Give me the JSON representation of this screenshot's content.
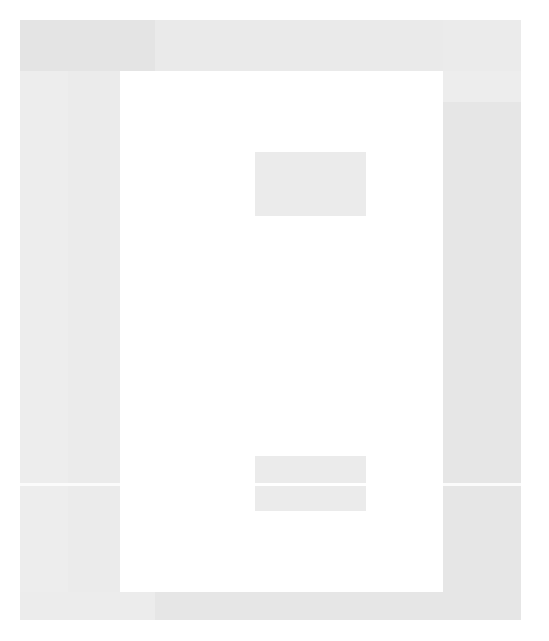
{
  "window": {
    "title": "",
    "width": 549,
    "height": 641,
    "appearance": "faded-low-contrast"
  },
  "colors": {
    "page_background": "#ffffff",
    "chrome_frame": "#eeeeee",
    "top_bar": "#eaeaea",
    "top_bar_left": "#e4e4e4",
    "sidebar_left": "#ebebeb",
    "sidebar_left_band": "#ededed",
    "sidebar_right": "#ededed",
    "sidebar_right_panel": "#e6e6e6",
    "status_bar": "#e6e6e6",
    "status_bar_left": "#ececec",
    "content_canvas": "#ffffff",
    "placeholder_block": "#ebebeb",
    "divider": "#fbfbfb"
  },
  "top_bar": {
    "title": "",
    "left_section_label": "",
    "right_section_label": ""
  },
  "sidebar_left": {
    "header_label": "",
    "items": [],
    "footer_label": ""
  },
  "sidebar_right": {
    "header_label": "",
    "panel_label": "",
    "items": [],
    "footer_label": ""
  },
  "content": {
    "heading": "",
    "blocks": [
      {
        "id": "block-top",
        "label": ""
      },
      {
        "id": "block-bottom-upper",
        "label": ""
      },
      {
        "id": "block-bottom-lower",
        "label": ""
      }
    ]
  },
  "status_bar": {
    "left_label": "",
    "center_label": "",
    "right_label": ""
  }
}
